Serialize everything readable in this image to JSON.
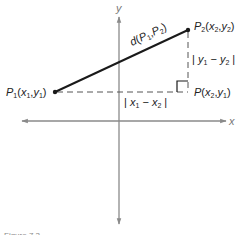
{
  "diagram": {
    "type": "distance-formula-figure",
    "axes": {
      "x_label": "x",
      "y_label": "y",
      "color": "#8a8a8a"
    },
    "points": {
      "p1": {
        "label": "P",
        "sub": "1",
        "coords": "(x₁,y₁)",
        "text": "P₁(x₁,y₁)"
      },
      "p2": {
        "label": "P",
        "sub": "2",
        "coords": "(x₂,y₂)",
        "text": "P₂(x₂,y₂)"
      },
      "p": {
        "label": "P",
        "coords": "(x₂,y₁)",
        "text": "P(x₂,y₁)"
      }
    },
    "segments": {
      "hypotenuse_label": "d(P₁,P₂)",
      "horizontal_label": "|x₁ − x₂|",
      "vertical_label": "|y₁ − y₂|"
    },
    "colors": {
      "line": "#1a1a1a",
      "dashed": "#555555",
      "axis": "#8a8a8a"
    },
    "caption": "Figure 7.3"
  }
}
